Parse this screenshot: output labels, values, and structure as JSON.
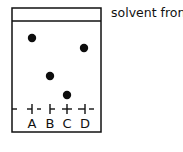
{
  "diagram": {
    "type": "thin-layer-chromatography-plate",
    "solvent_front_label": "solvent front",
    "plate": {
      "x": 12,
      "y": 8,
      "width": 89,
      "height": 124,
      "solvent_front_y": 21,
      "baseline_y": 109,
      "stroke": "#111111"
    },
    "lanes": [
      {
        "label": "A",
        "x": 32,
        "tick_style": "left-dash",
        "spot": {
          "x": 32,
          "y": 38,
          "r": 4.2
        }
      },
      {
        "label": "B",
        "x": 50,
        "tick_style": "right-dash",
        "spot": {
          "x": 50,
          "y": 76,
          "r": 4.2
        }
      },
      {
        "label": "C",
        "x": 67,
        "tick_style": "cross",
        "spot": {
          "x": 67,
          "y": 95,
          "r": 4.2
        }
      },
      {
        "label": "D",
        "x": 85,
        "tick_style": "left-dash",
        "spot": {
          "x": 84,
          "y": 48,
          "r": 4.2
        }
      }
    ],
    "baseline_dashes": [
      [
        12,
        17
      ],
      [
        27,
        32
      ],
      [
        37,
        41
      ],
      [
        50,
        55
      ],
      [
        62,
        72
      ],
      [
        78,
        85
      ],
      [
        89,
        94
      ]
    ],
    "colors": {
      "ink": "#111111",
      "spot": "#0d0d0d",
      "background": "#ffffff"
    }
  }
}
